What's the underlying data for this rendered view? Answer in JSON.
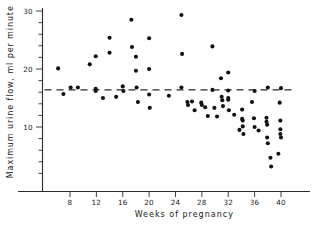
{
  "chart_data": {
    "type": "scatter",
    "title": "",
    "xlabel": "Weeks of pregnancy",
    "ylabel": "Maximum urine flow, ml per minute",
    "xlim": [
      4,
      43
    ],
    "ylim": [
      1,
      30.5
    ],
    "grid": false,
    "legend": null,
    "x_ticks": [
      8,
      12,
      16,
      20,
      24,
      28,
      32,
      36,
      40
    ],
    "x_tick_labels": [
      "8",
      "12",
      "16",
      "20",
      "24",
      "28",
      "32",
      "36",
      "40"
    ],
    "y_ticks": [
      2,
      4,
      6,
      8,
      10,
      12,
      14,
      16,
      18,
      20,
      22,
      24,
      26,
      28,
      30
    ],
    "y_tick_labels": [
      "",
      "",
      "",
      "",
      "10",
      "",
      "",
      "",
      "",
      "20",
      "",
      "",
      "",
      "",
      "30"
    ],
    "y_major_ticks": [
      10,
      20,
      30
    ],
    "reference_line": {
      "label": "",
      "orientation": "horizontal",
      "value": 16.4,
      "style": "dashed"
    },
    "point_color": "#111111",
    "axis_color": "#2b2b2b",
    "points": [
      {
        "x": 6.2,
        "y": 20.1
      },
      {
        "x": 7.0,
        "y": 15.7
      },
      {
        "x": 8.1,
        "y": 16.8
      },
      {
        "x": 9.2,
        "y": 16.8
      },
      {
        "x": 11.0,
        "y": 20.8
      },
      {
        "x": 11.9,
        "y": 22.2
      },
      {
        "x": 11.9,
        "y": 16.6
      },
      {
        "x": 11.9,
        "y": 16.2
      },
      {
        "x": 13.0,
        "y": 15.0
      },
      {
        "x": 14.0,
        "y": 25.4
      },
      {
        "x": 14.0,
        "y": 22.8
      },
      {
        "x": 15.0,
        "y": 15.2
      },
      {
        "x": 16.0,
        "y": 17.0
      },
      {
        "x": 16.1,
        "y": 16.2
      },
      {
        "x": 17.3,
        "y": 28.5
      },
      {
        "x": 17.4,
        "y": 23.8
      },
      {
        "x": 18.0,
        "y": 22.1
      },
      {
        "x": 18.0,
        "y": 19.7
      },
      {
        "x": 18.1,
        "y": 16.8
      },
      {
        "x": 18.3,
        "y": 14.3
      },
      {
        "x": 20.0,
        "y": 25.3
      },
      {
        "x": 20.0,
        "y": 20.0
      },
      {
        "x": 20.0,
        "y": 15.6
      },
      {
        "x": 20.1,
        "y": 13.3
      },
      {
        "x": 23.0,
        "y": 15.4
      },
      {
        "x": 24.9,
        "y": 29.3
      },
      {
        "x": 25.0,
        "y": 22.6
      },
      {
        "x": 24.9,
        "y": 16.8
      },
      {
        "x": 25.8,
        "y": 14.3
      },
      {
        "x": 25.9,
        "y": 13.8
      },
      {
        "x": 26.5,
        "y": 14.4
      },
      {
        "x": 26.9,
        "y": 12.9
      },
      {
        "x": 27.9,
        "y": 14.2
      },
      {
        "x": 28.0,
        "y": 13.8
      },
      {
        "x": 28.5,
        "y": 13.4
      },
      {
        "x": 28.9,
        "y": 11.9
      },
      {
        "x": 29.6,
        "y": 23.9
      },
      {
        "x": 29.6,
        "y": 16.4
      },
      {
        "x": 29.9,
        "y": 13.3
      },
      {
        "x": 30.3,
        "y": 11.8
      },
      {
        "x": 30.9,
        "y": 18.4
      },
      {
        "x": 31.0,
        "y": 15.2
      },
      {
        "x": 31.1,
        "y": 14.6
      },
      {
        "x": 31.2,
        "y": 13.6
      },
      {
        "x": 32.0,
        "y": 19.4
      },
      {
        "x": 32.0,
        "y": 16.3
      },
      {
        "x": 32.0,
        "y": 15.0
      },
      {
        "x": 32.0,
        "y": 14.7
      },
      {
        "x": 32.1,
        "y": 12.9
      },
      {
        "x": 32.9,
        "y": 12.1
      },
      {
        "x": 33.7,
        "y": 9.5
      },
      {
        "x": 34.1,
        "y": 13.0
      },
      {
        "x": 34.1,
        "y": 11.4
      },
      {
        "x": 34.2,
        "y": 11.1
      },
      {
        "x": 34.2,
        "y": 10.1
      },
      {
        "x": 34.3,
        "y": 8.8
      },
      {
        "x": 35.6,
        "y": 14.3
      },
      {
        "x": 36.0,
        "y": 16.2
      },
      {
        "x": 35.9,
        "y": 11.5
      },
      {
        "x": 36.0,
        "y": 10.0
      },
      {
        "x": 36.6,
        "y": 9.4
      },
      {
        "x": 37.8,
        "y": 11.6
      },
      {
        "x": 37.8,
        "y": 10.9
      },
      {
        "x": 37.9,
        "y": 10.4
      },
      {
        "x": 37.9,
        "y": 8.2
      },
      {
        "x": 38.0,
        "y": 7.2
      },
      {
        "x": 38.0,
        "y": 16.8
      },
      {
        "x": 38.4,
        "y": 4.7
      },
      {
        "x": 38.5,
        "y": 3.2
      },
      {
        "x": 39.8,
        "y": 14.2
      },
      {
        "x": 40.0,
        "y": 16.7
      },
      {
        "x": 39.9,
        "y": 11.1
      },
      {
        "x": 39.9,
        "y": 9.6
      },
      {
        "x": 39.9,
        "y": 8.8
      },
      {
        "x": 40.0,
        "y": 8.2
      },
      {
        "x": 39.6,
        "y": 5.4
      }
    ]
  }
}
